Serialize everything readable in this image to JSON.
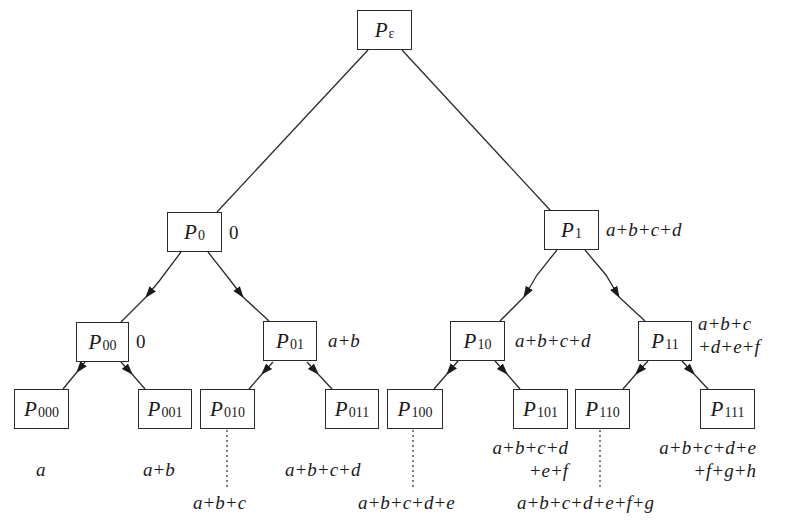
{
  "diagram": {
    "type": "binary-tree-prefix-sum",
    "nodes": [
      {
        "id": "eps",
        "main": "P",
        "sub": "ε",
        "label": ""
      },
      {
        "id": "0",
        "main": "P",
        "sub": "0",
        "label": "0"
      },
      {
        "id": "1",
        "main": "P",
        "sub": "1",
        "label": "a+b+c+d"
      },
      {
        "id": "00",
        "main": "P",
        "sub": "00",
        "label": "0"
      },
      {
        "id": "01",
        "main": "P",
        "sub": "01",
        "label": "a+b"
      },
      {
        "id": "10",
        "main": "P",
        "sub": "10",
        "label": "a+b+c+d"
      },
      {
        "id": "11",
        "main": "P",
        "sub": "11",
        "label_line1": "a+b+c",
        "label_line2": "+d+e+f"
      },
      {
        "id": "000",
        "main": "P",
        "sub": "000",
        "label": "a"
      },
      {
        "id": "001",
        "main": "P",
        "sub": "001",
        "label": "a+b"
      },
      {
        "id": "010",
        "main": "P",
        "sub": "010",
        "label": "a+b+c"
      },
      {
        "id": "011",
        "main": "P",
        "sub": "011",
        "label": "a+b+c+d"
      },
      {
        "id": "100",
        "main": "P",
        "sub": "100",
        "label": "a+b+c+d+e"
      },
      {
        "id": "101",
        "main": "P",
        "sub": "101",
        "label_line1": "a+b+c+d",
        "label_line2": "+e+f"
      },
      {
        "id": "110",
        "main": "P",
        "sub": "110",
        "label": "a+b+c+d+e+f+g"
      },
      {
        "id": "111",
        "main": "P",
        "sub": "111",
        "label_line1": "a+b+c+d+e",
        "label_line2": "+f+g+h"
      }
    ],
    "edges": [
      {
        "from": "eps",
        "to": "0",
        "style": "solid"
      },
      {
        "from": "eps",
        "to": "1",
        "style": "solid"
      },
      {
        "from": "0",
        "to": "00",
        "style": "arrow"
      },
      {
        "from": "0",
        "to": "01",
        "style": "arrow"
      },
      {
        "from": "1",
        "to": "10",
        "style": "arrow"
      },
      {
        "from": "1",
        "to": "11",
        "style": "arrow"
      },
      {
        "from": "00",
        "to": "000",
        "style": "arrow"
      },
      {
        "from": "00",
        "to": "001",
        "style": "arrow"
      },
      {
        "from": "01",
        "to": "010",
        "style": "arrow"
      },
      {
        "from": "01",
        "to": "011",
        "style": "arrow"
      },
      {
        "from": "10",
        "to": "100",
        "style": "arrow"
      },
      {
        "from": "10",
        "to": "101",
        "style": "arrow"
      },
      {
        "from": "11",
        "to": "110",
        "style": "arrow"
      },
      {
        "from": "11",
        "to": "111",
        "style": "arrow"
      },
      {
        "from": "010",
        "to": "label-010",
        "style": "dotted"
      },
      {
        "from": "100",
        "to": "label-100",
        "style": "dotted"
      },
      {
        "from": "110",
        "to": "label-110",
        "style": "dotted"
      }
    ]
  }
}
